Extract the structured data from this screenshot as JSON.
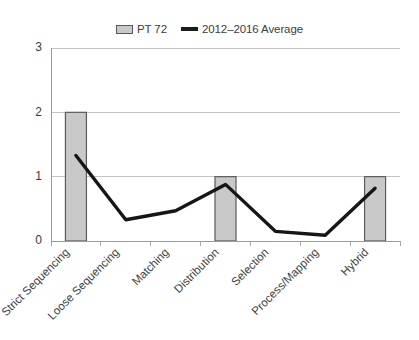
{
  "chart_data": {
    "type": "bar",
    "title": "",
    "subtitle": "",
    "xlabel": "",
    "ylabel": "",
    "ylim": [
      0,
      3
    ],
    "yticks": [
      "0",
      "1",
      "2",
      "3"
    ],
    "grid": true,
    "legend_position": "top-center",
    "categories": [
      "Strict Sequencing",
      "Loose Sequencing",
      "Matching",
      "Distribution",
      "Selection",
      "Process/Mapping",
      "Hybrid"
    ],
    "series": [
      {
        "name": "PT 72",
        "type": "bar",
        "color": "#c9c9c9",
        "border_color": "#5a5a5a",
        "values": [
          2,
          0,
          0,
          1,
          0,
          0,
          1
        ]
      },
      {
        "name": "2012–2016 Average",
        "type": "line",
        "color": "#161616",
        "values": [
          1.33,
          0.33,
          0.47,
          0.88,
          0.15,
          0.09,
          0.82
        ]
      }
    ]
  },
  "legend": {
    "items": [
      {
        "label": "PT 72",
        "swatch": "bar-swatch-icon"
      },
      {
        "label": "2012–2016 Average",
        "swatch": "line-swatch-icon"
      }
    ]
  },
  "axes": {
    "y": {
      "ticks": [
        "0",
        "1",
        "2",
        "3"
      ]
    },
    "x": {
      "ticks": [
        "Strict Sequencing",
        "Loose Sequencing",
        "Matching",
        "Distribution",
        "Selection",
        "Process/Mapping",
        "Hybrid"
      ]
    }
  }
}
